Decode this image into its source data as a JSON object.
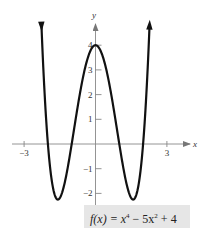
{
  "chart_data": {
    "type": "line",
    "title": "",
    "xlabel": "x",
    "ylabel": "y",
    "xlim": [
      -3.5,
      3.9
    ],
    "ylim": [
      -2.6,
      5.3
    ],
    "x_ticks": [
      -3,
      3
    ],
    "x_tick_labels": [
      "−3",
      "3"
    ],
    "y_ticks": [
      -2,
      -1,
      1,
      2,
      3,
      4
    ],
    "y_tick_labels": [
      "−2",
      "−1",
      "1",
      "2",
      "3",
      "4"
    ],
    "grid": false,
    "legend": null,
    "series": [
      {
        "name": "f(x) = x^4 - 5x^2 + 4",
        "expression": "x^4 - 5x^2 + 4",
        "x_range": [
          -2.27,
          2.27
        ],
        "key_points": [
          {
            "x": -2,
            "y": 0
          },
          {
            "x": -1.58,
            "y": -2.25
          },
          {
            "x": -1,
            "y": 0
          },
          {
            "x": 0,
            "y": 4
          },
          {
            "x": 1,
            "y": 0
          },
          {
            "x": 1.58,
            "y": -2.25
          },
          {
            "x": 2,
            "y": 0
          }
        ],
        "color": "#1a1a1a"
      }
    ],
    "annotations": [
      {
        "text": "f(x) = x⁴ − 5x² + 4",
        "position": "bottom-right"
      }
    ]
  },
  "labels": {
    "x_axis": "x",
    "y_axis": "y",
    "function_prefix": "f(x) = x",
    "exp4": "4",
    "mid": " − 5x",
    "exp2": "2",
    "suffix": " + 4"
  }
}
